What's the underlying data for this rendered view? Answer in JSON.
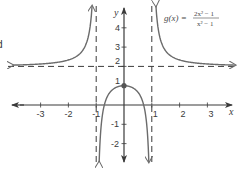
{
  "chart_data": {
    "type": "line",
    "title": "",
    "function_label": {
      "name": "g(x) =",
      "numerator": "2x² − 1",
      "denominator": "x² − 1"
    },
    "xlabel": "x",
    "ylabel": "y",
    "xlim": [
      -4.0,
      4.0
    ],
    "ylim": [
      -2.9,
      5.0
    ],
    "x_ticks": [
      -3,
      -2,
      -1,
      1,
      2,
      3
    ],
    "x_tick_labels": [
      "-3",
      "-2",
      "-1",
      "1",
      "2",
      "3"
    ],
    "y_ticks": [
      -2,
      -1,
      1,
      2,
      3,
      4
    ],
    "y_tick_labels": [
      "-2",
      "-1",
      "1",
      "2",
      "3",
      "4"
    ],
    "grid": false,
    "asymptotes": {
      "vertical": [
        -1,
        1
      ],
      "horizontal": [
        2
      ]
    },
    "series": [
      {
        "name": "g(x) left branch",
        "domain": [
          -4.0,
          -1.0
        ],
        "expression": "(2x^2-1)/(x^2-1)"
      },
      {
        "name": "g(x) middle branch",
        "domain": [
          -1.0,
          1.0
        ],
        "expression": "(2x^2-1)/(x^2-1)"
      },
      {
        "name": "g(x) right branch",
        "domain": [
          1.0,
          4.0
        ],
        "expression": "(2x^2-1)/(x^2-1)"
      }
    ],
    "points": [
      {
        "x": 0,
        "y": 1,
        "label": "local maximum"
      }
    ],
    "colors": {
      "curve": "#6b6b6b",
      "axes": "#3a3a3a",
      "asymptote": "#3a3a3a"
    }
  },
  "edge_text": "d"
}
